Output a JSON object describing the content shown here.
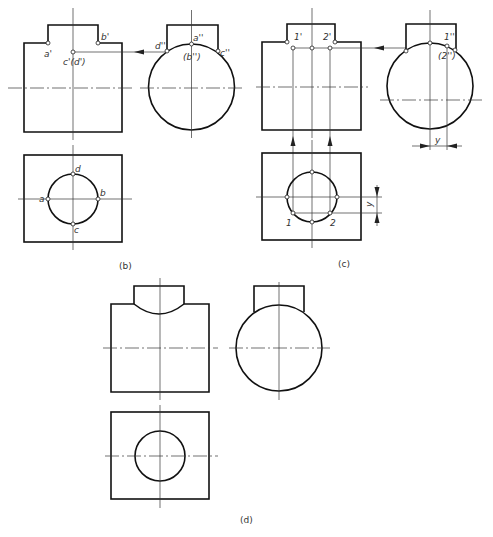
{
  "figure": {
    "panels": [
      {
        "id": "b",
        "caption": "(b)",
        "labels": {
          "a_prime": "a'",
          "b_prime": "b'",
          "cd_prime": "c'(d')",
          "d_dprime": "d''",
          "a_dprime": "a''",
          "b_dprime": "(b'')",
          "c_dprime": "c''",
          "a": "a",
          "b": "b",
          "c": "c",
          "d": "d"
        }
      },
      {
        "id": "c",
        "caption": "(c)",
        "labels": {
          "p1_prime": "1'",
          "p2_prime": "2'",
          "p1_dprime": "1''",
          "p2_dprime": "(2'')",
          "p1": "1",
          "p2": "2",
          "dim_y_side": "y",
          "dim_y_top": "y"
        }
      },
      {
        "id": "d",
        "caption": "(d)"
      }
    ]
  }
}
